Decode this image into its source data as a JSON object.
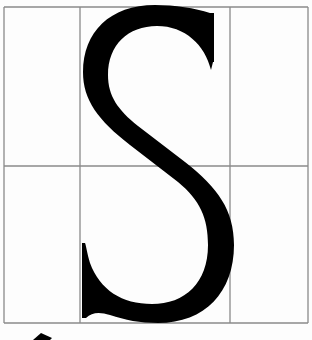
{
  "diagram": {
    "letter": "S",
    "grid": {
      "columns": 3,
      "rows": 2,
      "vertical_lines_x": [
        4,
        80,
        230,
        308
      ],
      "horizontal_lines_y": [
        7,
        166,
        323
      ],
      "line_color": "#8a8a8a"
    },
    "glyph_color": "#000000",
    "background_color": "#fdfdfd",
    "pointer": {
      "shape": "arrow",
      "position": "bottom-left",
      "color": "#000000"
    }
  }
}
